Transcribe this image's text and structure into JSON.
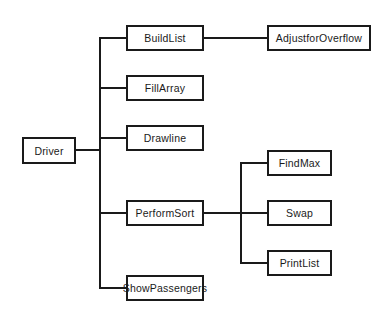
{
  "diagram": {
    "type": "structure-chart",
    "root": "Driver",
    "nodes": [
      {
        "id": "driver",
        "label": "Driver"
      },
      {
        "id": "buildlist",
        "label": "BuildList",
        "parent": "driver"
      },
      {
        "id": "fillarray",
        "label": "FillArray",
        "parent": "driver"
      },
      {
        "id": "drawline",
        "label": "Drawline",
        "parent": "driver"
      },
      {
        "id": "performsort",
        "label": "PerformSort",
        "parent": "driver"
      },
      {
        "id": "showpassengers",
        "label": "ShowPassengers",
        "parent": "driver"
      },
      {
        "id": "adjustforoverflow",
        "label": "AdjustforOverflow",
        "parent": "buildlist"
      },
      {
        "id": "findmax",
        "label": "FindMax",
        "parent": "performsort"
      },
      {
        "id": "swap",
        "label": "Swap",
        "parent": "performsort"
      },
      {
        "id": "printlist",
        "label": "PrintList",
        "parent": "performsort"
      }
    ],
    "colors": {
      "line": "#1a1a1a",
      "box_fill": "#ffffff",
      "background": "#ffffff"
    }
  }
}
